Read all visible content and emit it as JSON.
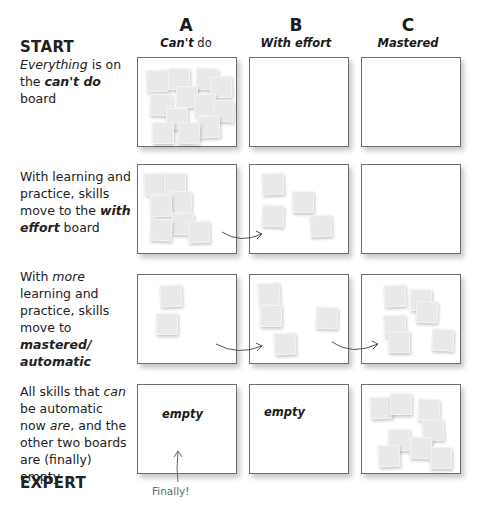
{
  "top_caption": "(page 1)",
  "columns": [
    {
      "letter": "A",
      "label_bold": "Can't",
      "label_rest": " do"
    },
    {
      "letter": "B",
      "label_bold": "With effort",
      "label_rest": ""
    },
    {
      "letter": "C",
      "label_bold": "Mastered",
      "label_rest": ""
    }
  ],
  "rows": [
    {
      "heading": "START",
      "parts": [
        {
          "t": "Everything",
          "s": "i"
        },
        {
          "t": " is on the ",
          "s": ""
        },
        {
          "t": "can't do",
          "s": "b"
        },
        {
          "t": " board",
          "s": ""
        }
      ]
    },
    {
      "heading": "",
      "parts": [
        {
          "t": "With learning and practice, skills move to the ",
          "s": ""
        },
        {
          "t": "with effort",
          "s": "b"
        },
        {
          "t": " board",
          "s": ""
        }
      ]
    },
    {
      "heading": "",
      "parts": [
        {
          "t": "With ",
          "s": ""
        },
        {
          "t": "more",
          "s": "i"
        },
        {
          "t": " learning and practice, skills move to ",
          "s": ""
        },
        {
          "t": "mastered/ automatic",
          "s": "b"
        }
      ]
    },
    {
      "heading": "",
      "parts": [
        {
          "t": "All skills that ",
          "s": ""
        },
        {
          "t": "can",
          "s": "i"
        },
        {
          "t": " be automatic now ",
          "s": ""
        },
        {
          "t": "are",
          "s": "i"
        },
        {
          "t": ", and the other two boards are (finally) empty",
          "s": ""
        }
      ]
    }
  ],
  "footer_heading": "EXPERT",
  "empty_label": "empty",
  "finally_note": "Finally!",
  "colors": {
    "board_border": "#6f6f6f",
    "note_fill": "#e9e9e9",
    "arrow": "#555555"
  },
  "boards": {
    "r0c0": [
      [
        8,
        12
      ],
      [
        30,
        10
      ],
      [
        58,
        10
      ],
      [
        72,
        18
      ],
      [
        38,
        28
      ],
      [
        12,
        36
      ],
      [
        56,
        36
      ],
      [
        28,
        50
      ],
      [
        74,
        42
      ],
      [
        60,
        58
      ],
      [
        14,
        64
      ],
      [
        40,
        64
      ]
    ],
    "r0c1": [],
    "r0c2": [],
    "r1c0": [
      [
        6,
        8
      ],
      [
        26,
        8
      ],
      [
        32,
        26
      ],
      [
        12,
        30
      ],
      [
        34,
        48
      ],
      [
        12,
        54
      ],
      [
        50,
        56
      ]
    ],
    "r1c1": [
      [
        12,
        8
      ],
      [
        42,
        26
      ],
      [
        12,
        40
      ],
      [
        60,
        50
      ]
    ],
    "r1c2": [],
    "r2c0": [
      [
        22,
        10
      ],
      [
        18,
        38
      ]
    ],
    "r2c1": [
      [
        8,
        8
      ],
      [
        10,
        30
      ],
      [
        66,
        32
      ],
      [
        24,
        58
      ]
    ],
    "r2c2": [
      [
        22,
        10
      ],
      [
        48,
        14
      ],
      [
        54,
        26
      ],
      [
        22,
        40
      ],
      [
        26,
        56
      ],
      [
        70,
        54
      ]
    ],
    "r3c0": [],
    "r3c1": [],
    "r3c2": [
      [
        8,
        12
      ],
      [
        28,
        8
      ],
      [
        56,
        14
      ],
      [
        60,
        34
      ],
      [
        26,
        44
      ],
      [
        48,
        52
      ],
      [
        16,
        60
      ],
      [
        68,
        62
      ]
    ]
  }
}
